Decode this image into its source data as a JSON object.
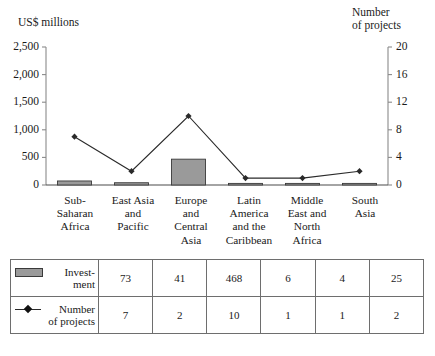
{
  "chart_data": {
    "type": "bar",
    "title": "",
    "categories": [
      "Sub-\nSaharan\nAfrica",
      "East Asia\nand\nPacific",
      "Europe\nand\nCentral\nAsia",
      "Latin\nAmerica\nand the\nCaribbean",
      "Middle\nEast and\nNorth\nAfrica",
      "South\nAsia"
    ],
    "categories_flat": [
      "Sub-Saharan Africa",
      "East Asia and Pacific",
      "Europe and Central Asia",
      "Latin America and the Caribbean",
      "Middle East and North Africa",
      "South Asia"
    ],
    "series": [
      {
        "name": "Investment",
        "type": "bar",
        "axis": "left",
        "unit": "US$ millions",
        "values": [
          73,
          41,
          468,
          6,
          4,
          25
        ],
        "color": "#9a9a9a",
        "edge_color": "#3a3a3a"
      },
      {
        "name": "Number of projects",
        "type": "line",
        "axis": "right",
        "unit": "projects",
        "values": [
          7,
          2,
          10,
          1,
          1,
          2
        ],
        "color": "#2a2a2a",
        "marker": "diamond"
      }
    ],
    "xlabel": "",
    "ylabel": "US$ millions",
    "y2label": "Number of projects",
    "ylim": [
      0,
      2500
    ],
    "y2lim": [
      0,
      20
    ],
    "yticks": [
      0,
      500,
      1000,
      1500,
      2000,
      2500
    ],
    "yticklabels": [
      "0",
      "500",
      "1,000",
      "1,500",
      "2,000",
      "2,500"
    ],
    "y2ticks": [
      0,
      4,
      8,
      12,
      16,
      20
    ],
    "y2ticklabels": [
      "0",
      "4",
      "8",
      "12",
      "16",
      "20"
    ],
    "grid": false,
    "legend_position": "table-below"
  },
  "axes": {
    "left_title": "US$ millions",
    "right_title": "Number\nof projects"
  },
  "table": {
    "rows": [
      {
        "legend_label": "Invest-\nment",
        "legend_icon": "gray-bar-swatch",
        "values": [
          "73",
          "41",
          "468",
          "6",
          "4",
          "25"
        ]
      },
      {
        "legend_label": "Number\nof projects",
        "legend_icon": "line-marker-swatch",
        "values": [
          "7",
          "2",
          "10",
          "1",
          "1",
          "2"
        ]
      }
    ]
  },
  "colors": {
    "bar_fill": "#9a9a9a",
    "bar_edge": "#3a3a3a",
    "line": "#2a2a2a",
    "axis": "#8a8a8a",
    "text": "#1a1a1a",
    "table_border": "#6e6e6e"
  }
}
